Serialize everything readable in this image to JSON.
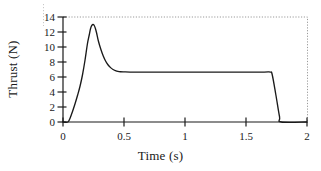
{
  "chart_data": {
    "type": "line",
    "title": "",
    "xlabel": "Time (s)",
    "ylabel": "Thrust (N)",
    "xlim": [
      0,
      2
    ],
    "ylim": [
      0,
      14
    ],
    "xticks": [
      "0",
      "0.5",
      "1",
      "1.5",
      "2"
    ],
    "xtick_values": [
      0,
      0.5,
      1,
      1.5,
      2
    ],
    "yticks": [
      "0",
      "2",
      "4",
      "6",
      "8",
      "10",
      "12",
      "14"
    ],
    "ytick_values": [
      0,
      2,
      4,
      6,
      8,
      10,
      12,
      14
    ],
    "grid": false,
    "legend": null,
    "series": [
      {
        "name": "Thrust",
        "color": "#1a1a1a",
        "x": [
          0.0,
          0.04,
          0.06,
          0.08,
          0.1,
          0.12,
          0.14,
          0.16,
          0.18,
          0.2,
          0.215,
          0.225,
          0.235,
          0.245,
          0.255,
          0.265,
          0.275,
          0.29,
          0.31,
          0.33,
          0.35,
          0.37,
          0.39,
          0.41,
          0.43,
          0.45,
          0.47,
          0.5,
          0.55,
          0.7,
          0.9,
          1.1,
          1.3,
          1.5,
          1.65,
          1.7,
          1.715,
          1.745,
          1.775,
          1.79,
          2.0
        ],
        "y": [
          0.0,
          0.0,
          0.6,
          1.5,
          2.5,
          3.6,
          4.8,
          6.3,
          8.2,
          10.4,
          11.6,
          12.4,
          12.85,
          13.0,
          12.9,
          12.5,
          11.9,
          10.8,
          9.7,
          8.8,
          8.1,
          7.6,
          7.25,
          7.0,
          6.85,
          6.75,
          6.7,
          6.68,
          6.66,
          6.66,
          6.66,
          6.66,
          6.66,
          6.66,
          6.66,
          6.66,
          6.3,
          3.6,
          0.7,
          0.0,
          0.0
        ]
      }
    ],
    "annotations": {
      "peak_thrust": 13.0,
      "peak_time": 0.245,
      "plateau_thrust": 6.66,
      "burn_start": 0.045,
      "burn_end": 1.79
    },
    "colors": {
      "curve": "#1a1a1a",
      "axis": "#1a1a1a",
      "border": "#9a9a9a",
      "background": "#ffffff"
    }
  }
}
